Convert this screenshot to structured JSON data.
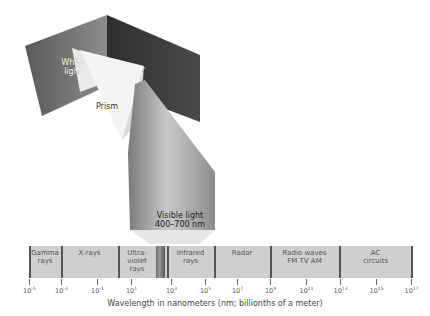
{
  "figure": {
    "prism_labels": {
      "white_light": "White light",
      "prism": "Prism",
      "visible_light": "Visible light",
      "visible_range": "400–700 nm"
    },
    "spectrum": {
      "bands": [
        {
          "label": "Gamma rays",
          "x0": 0,
          "x1": 32
        },
        {
          "label": "X-rays",
          "x0": 32,
          "x1": 89
        },
        {
          "label": "Ultra-violet rays",
          "x0": 89,
          "x1": 127
        },
        {
          "label": "Infrared rays",
          "x0": 138,
          "x1": 185
        },
        {
          "label": "Radar",
          "x0": 185,
          "x1": 241
        },
        {
          "label": "Radio waves FM TV AM",
          "x0": 241,
          "x1": 310
        },
        {
          "label": "AC circuits",
          "x0": 310,
          "x1": 383
        }
      ],
      "visible_strip": {
        "x0": 127,
        "x1": 136
      },
      "separators": [
        0,
        32,
        89,
        127,
        138,
        185,
        241,
        310,
        383
      ],
      "ticks": [
        {
          "base": "10",
          "exp": "-5",
          "x": 29
        },
        {
          "base": "10",
          "exp": "-3",
          "x": 61
        },
        {
          "base": "10",
          "exp": "-1",
          "x": 97
        },
        {
          "base": "10",
          "exp": "1",
          "x": 131
        },
        {
          "base": "10",
          "exp": "3",
          "x": 171
        },
        {
          "base": "10",
          "exp": "5",
          "x": 205
        },
        {
          "base": "10",
          "exp": "7",
          "x": 237
        },
        {
          "base": "10",
          "exp": "9",
          "x": 270
        },
        {
          "base": "10",
          "exp": "11",
          "x": 306
        },
        {
          "base": "10",
          "exp": "13",
          "x": 340
        },
        {
          "base": "10",
          "exp": "15",
          "x": 376
        },
        {
          "base": "10",
          "exp": "17",
          "x": 411
        }
      ],
      "axis_label": "Wavelength in nanometers (nm; billionths of a meter)"
    }
  }
}
